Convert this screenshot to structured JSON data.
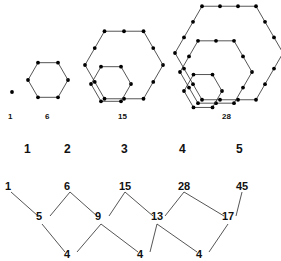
{
  "figures": [
    {
      "label": "1",
      "label_x": 8,
      "label_y": 112,
      "points": 1
    },
    {
      "label": "6",
      "label_x": 45,
      "label_y": 112,
      "points": 6
    },
    {
      "label": "15",
      "label_x": 118,
      "label_y": 112,
      "points": 15
    },
    {
      "label": "28",
      "label_x": 222,
      "label_y": 112,
      "points": 28
    }
  ],
  "index_row": [
    {
      "text": "1",
      "x": 24,
      "y": 142
    },
    {
      "text": "2",
      "x": 64,
      "y": 142
    },
    {
      "text": "3",
      "x": 121,
      "y": 142
    },
    {
      "text": "4",
      "x": 179,
      "y": 142
    },
    {
      "text": "5",
      "x": 236,
      "y": 142
    }
  ],
  "difference_table": {
    "row1": [
      {
        "text": "1",
        "x": 5,
        "y": 180
      },
      {
        "text": "6",
        "x": 64,
        "y": 180
      },
      {
        "text": "15",
        "x": 119,
        "y": 180
      },
      {
        "text": "28",
        "x": 178,
        "y": 180
      },
      {
        "text": "45",
        "x": 236,
        "y": 180
      }
    ],
    "row2": [
      {
        "text": "5",
        "x": 36,
        "y": 210
      },
      {
        "text": "9",
        "x": 95,
        "y": 210
      },
      {
        "text": "13",
        "x": 151,
        "y": 210
      },
      {
        "text": "17",
        "x": 222,
        "y": 210
      }
    ],
    "row3": [
      {
        "text": "4",
        "x": 64,
        "y": 248
      },
      {
        "text": "4",
        "x": 137,
        "y": 248
      },
      {
        "text": "4",
        "x": 196,
        "y": 248
      }
    ]
  },
  "chart_data": {
    "type": "diagram",
    "sequence_values": [
      1,
      6,
      15,
      28,
      45
    ],
    "sequence_indices": [
      1,
      2,
      3,
      4,
      5
    ],
    "first_differences": [
      5,
      9,
      13,
      17
    ],
    "second_differences": [
      4,
      4,
      4
    ],
    "figure_dot_counts": [
      1,
      6,
      15,
      28
    ],
    "stroke_color": "#2a2a2a",
    "dot_color": "#000000"
  },
  "geometry": {
    "dot_radius": 1.9,
    "stroke_width": 0.8,
    "hexagons": [
      {
        "name": "fig1-dot",
        "cx": 12,
        "cy": 92,
        "r": 0
      },
      {
        "name": "fig2-hex",
        "cx": 48,
        "cy": 80,
        "r": 20,
        "subdiv": 1
      },
      {
        "name": "fig3-outer",
        "cx": 124,
        "cy": 65,
        "r": 39,
        "subdiv": 2
      },
      {
        "name": "fig3-inner",
        "cx": 111,
        "cy": 84,
        "r": 20,
        "subdiv": 1
      },
      {
        "name": "fig4-outer",
        "cx": 229,
        "cy": 53,
        "r": 54,
        "subdiv": 3
      },
      {
        "name": "fig4-mid",
        "cx": 216,
        "cy": 72,
        "r": 36,
        "subdiv": 2
      },
      {
        "name": "fig4-inner",
        "cx": 203,
        "cy": 91,
        "r": 19,
        "subdiv": 1
      }
    ]
  }
}
